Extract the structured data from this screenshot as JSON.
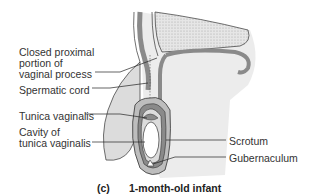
{
  "figure": {
    "panel_letter": "(c)",
    "caption": "1-month-old infant",
    "labels": {
      "closed_proximal_1": "Closed proximal",
      "closed_proximal_2": "portion of",
      "closed_proximal_3": "vaginal process",
      "spermatic_cord": "Spermatic cord",
      "tunica_vaginalis": "Tunica vaginalis",
      "cavity_1": "Cavity of",
      "cavity_2": "tunica vaginalis",
      "scrotum": "Scrotum",
      "gubernaculum": "Gubernaculum"
    },
    "colors": {
      "skin": "#dcdcdc",
      "tissue": "#bdbdbd",
      "dark_layer": "#8a8a8a",
      "outline": "#333333",
      "stipple": "#c8c8c8"
    }
  }
}
